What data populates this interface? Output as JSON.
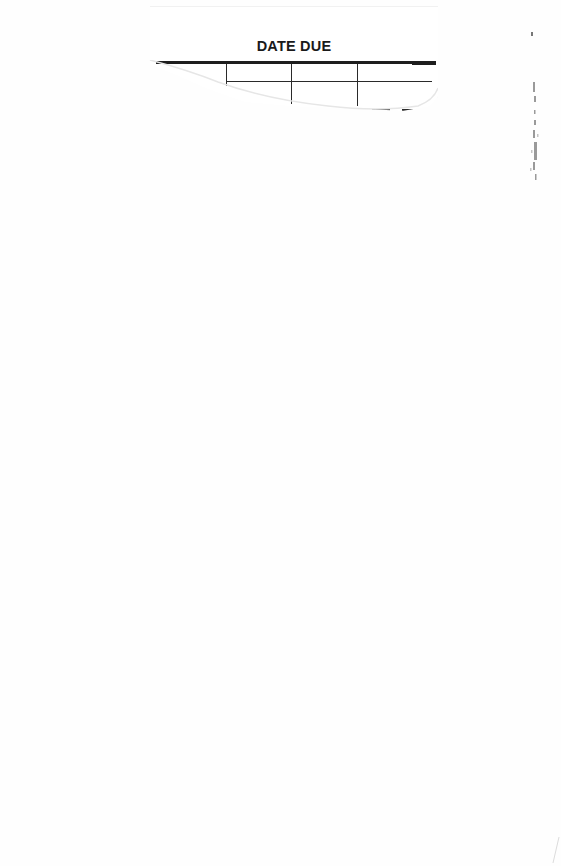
{
  "document": {
    "type": "scanned library book page",
    "slip": {
      "title": "DATE DUE",
      "columns": 4,
      "rows_visible": 1,
      "entries": []
    },
    "margin_marks": "faint illegible handwriting along right edge"
  }
}
